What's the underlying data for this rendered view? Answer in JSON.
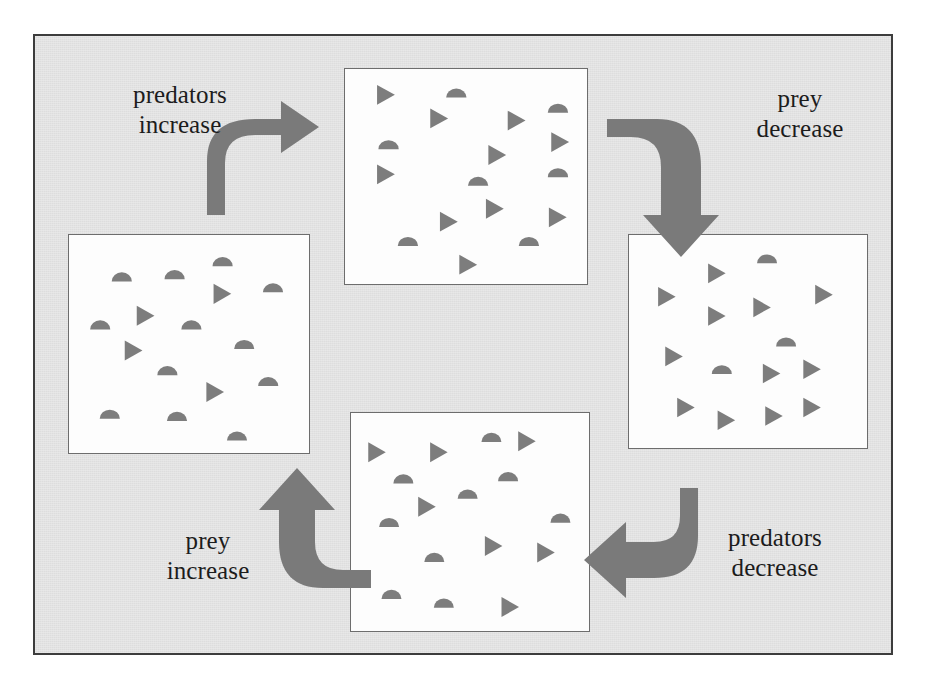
{
  "figure": {
    "background_color": "#e3e3e3",
    "frame_color": "#3d3d3d",
    "box_fill": "#fdfdfd",
    "box_border": "#6d6d6d",
    "organism_color": "#7d7d7d",
    "arrow_color": "#7a7a7a"
  },
  "labels": {
    "predators_increase": "predators\nincrease",
    "prey_decrease": "prey\ndecrease",
    "predators_decrease": "predators\ndecrease",
    "prey_increase": "prey\nincrease"
  },
  "legend": {
    "prey_symbol": "semicircle",
    "predator_symbol": "triangle"
  },
  "chart_data": {
    "type": "diagram",
    "cycle_order": [
      "box_top",
      "box_right",
      "box_bottom",
      "box_left"
    ],
    "transitions": [
      {
        "from": "box_left",
        "to": "box_top",
        "label": "predators increase",
        "direction": "curve-right-up"
      },
      {
        "from": "box_top",
        "to": "box_right",
        "label": "prey decrease",
        "direction": "curve-down"
      },
      {
        "from": "box_right",
        "to": "box_bottom",
        "label": "predators decrease",
        "direction": "curve-left"
      },
      {
        "from": "box_bottom",
        "to": "box_left",
        "label": "prey increase",
        "direction": "curve-up"
      }
    ],
    "panels": [
      {
        "id": "box_top",
        "position": "top",
        "prey_count": 7,
        "predator_count": 10,
        "description": "many prey and many predators",
        "prey": [
          [
            46,
            11
          ],
          [
            88,
            18
          ],
          [
            18,
            35
          ],
          [
            55,
            52
          ],
          [
            88,
            48
          ],
          [
            26,
            80
          ],
          [
            76,
            80
          ]
        ],
        "predators": [
          [
            16,
            12
          ],
          [
            38,
            23
          ],
          [
            70,
            24
          ],
          [
            88,
            34
          ],
          [
            62,
            40
          ],
          [
            16,
            49
          ],
          [
            61,
            65
          ],
          [
            42,
            71
          ],
          [
            87,
            69
          ],
          [
            50,
            91
          ]
        ]
      },
      {
        "id": "box_right",
        "position": "right",
        "prey_count": 2,
        "predator_count": 13,
        "description": "few prey and many predators",
        "prey": [
          [
            58,
            11
          ],
          [
            39,
            63
          ],
          [
            66,
            50
          ]
        ],
        "predators": [
          [
            36,
            18
          ],
          [
            15,
            29
          ],
          [
            36,
            38
          ],
          [
            55,
            34
          ],
          [
            81,
            28
          ],
          [
            18,
            57
          ],
          [
            59,
            65
          ],
          [
            76,
            63
          ],
          [
            23,
            81
          ],
          [
            40,
            87
          ],
          [
            60,
            85
          ],
          [
            76,
            81
          ]
        ]
      },
      {
        "id": "box_bottom",
        "position": "bottom",
        "prey_count": 9,
        "predator_count": 6,
        "description": "increasing prey and few predators",
        "prey": [
          [
            59,
            11
          ],
          [
            22,
            30
          ],
          [
            49,
            37
          ],
          [
            66,
            29
          ],
          [
            16,
            50
          ],
          [
            88,
            48
          ],
          [
            35,
            66
          ],
          [
            17,
            83
          ],
          [
            39,
            87
          ]
        ],
        "predators": [
          [
            10,
            18
          ],
          [
            36,
            18
          ],
          [
            73,
            13
          ],
          [
            31,
            43
          ],
          [
            59,
            61
          ],
          [
            81,
            64
          ],
          [
            66,
            89
          ]
        ]
      },
      {
        "id": "box_left",
        "position": "left",
        "prey_count": 12,
        "predator_count": 4,
        "description": "many prey and few predators",
        "prey": [
          [
            22,
            19
          ],
          [
            44,
            18
          ],
          [
            64,
            12
          ],
          [
            85,
            24
          ],
          [
            13,
            41
          ],
          [
            51,
            41
          ],
          [
            73,
            50
          ],
          [
            41,
            62
          ],
          [
            83,
            67
          ],
          [
            17,
            82
          ],
          [
            45,
            83
          ],
          [
            70,
            92
          ]
        ],
        "predators": [
          [
            63,
            27
          ],
          [
            31,
            37
          ],
          [
            26,
            53
          ],
          [
            60,
            72
          ]
        ]
      }
    ]
  }
}
